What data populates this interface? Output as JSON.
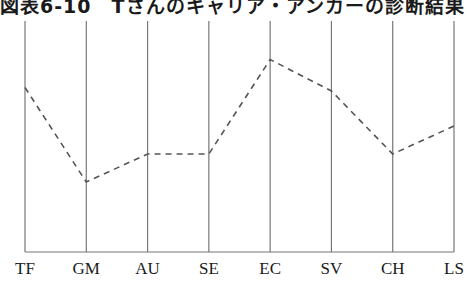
{
  "chart_data": {
    "type": "line",
    "title": "図表6-10　Tさんのキャリア・アンカーの診断結果",
    "categories": [
      "TF",
      "GM",
      "AU",
      "SE",
      "EC",
      "SV",
      "CH",
      "LS"
    ],
    "values": [
      4.7,
      2.0,
      2.8,
      2.8,
      5.5,
      4.6,
      2.8,
      3.6
    ],
    "series": [
      {
        "name": "Tさん",
        "values": [
          4.7,
          2.0,
          2.8,
          2.8,
          5.5,
          4.6,
          2.8,
          3.6
        ],
        "style": "dashed"
      }
    ],
    "xlabel": "",
    "ylabel": "",
    "ylim": [
      0,
      6
    ],
    "grid": "vertical lines per category",
    "legend": "none"
  },
  "header": {
    "title": "図表6-10　Tさんのキャリア・アンカーの診断結果"
  },
  "axis": {
    "labels": [
      "TF",
      "GM",
      "AU",
      "SE",
      "EC",
      "SV",
      "CH",
      "LS"
    ]
  }
}
